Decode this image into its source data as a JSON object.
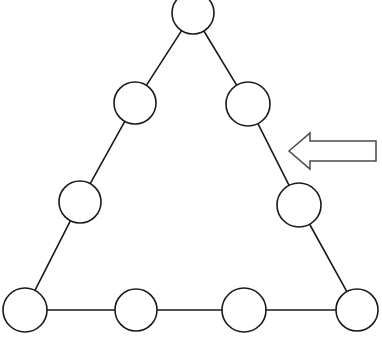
{
  "figure": {
    "background_color": "#ffffff",
    "stroke_color": "#1a1a1a",
    "fill_color": "#ffffff",
    "arrow_stroke_color": "#4a4a4a",
    "width": 382,
    "height": 341
  },
  "chart_data": {
    "type": "diagram",
    "title": "",
    "nodes": [
      {
        "id": "apex",
        "label": "",
        "cx": 193,
        "cy": 13,
        "r": 21,
        "clipped_top": true
      },
      {
        "id": "left-upper",
        "label": "",
        "cx": 135,
        "cy": 103,
        "r": 21,
        "clipped_top": false
      },
      {
        "id": "right-upper",
        "label": "",
        "cx": 248,
        "cy": 104,
        "r": 22,
        "clipped_top": false
      },
      {
        "id": "left-middle",
        "label": "",
        "cx": 80,
        "cy": 202,
        "r": 21,
        "clipped_top": false
      },
      {
        "id": "right-middle",
        "label": "",
        "cx": 299,
        "cy": 205,
        "r": 22,
        "clipped_top": false
      },
      {
        "id": "bottom-left",
        "label": "",
        "cx": 25,
        "cy": 310,
        "r": 22,
        "clipped_top": false
      },
      {
        "id": "bottom-second",
        "label": "",
        "cx": 136,
        "cy": 310,
        "r": 21,
        "clipped_top": false
      },
      {
        "id": "bottom-third",
        "label": "",
        "cx": 244,
        "cy": 310,
        "r": 22,
        "clipped_top": false
      },
      {
        "id": "bottom-right",
        "label": "",
        "cx": 357,
        "cy": 310,
        "r": 21,
        "clipped_top": false
      }
    ],
    "edges": [
      {
        "from": "apex",
        "to": "left-upper"
      },
      {
        "from": "left-upper",
        "to": "left-middle"
      },
      {
        "from": "left-middle",
        "to": "bottom-left"
      },
      {
        "from": "apex",
        "to": "right-upper"
      },
      {
        "from": "right-upper",
        "to": "right-middle"
      },
      {
        "from": "right-middle",
        "to": "bottom-right"
      },
      {
        "from": "bottom-left",
        "to": "bottom-second"
      },
      {
        "from": "bottom-second",
        "to": "bottom-third"
      },
      {
        "from": "bottom-third",
        "to": "bottom-right"
      }
    ],
    "annotations": [
      {
        "id": "pointer-arrow",
        "kind": "block-arrow",
        "direction": "left",
        "points_at": "right-side-of-triangle",
        "tip_x": 289,
        "tip_y": 151,
        "tail_x": 376,
        "shaft_top_y": 141,
        "shaft_bottom_y": 161,
        "barb_top_y": 133,
        "barb_bottom_y": 169,
        "barb_x": 310
      }
    ],
    "node_count": 9,
    "side_count": 3,
    "nodes_per_side": 4
  }
}
